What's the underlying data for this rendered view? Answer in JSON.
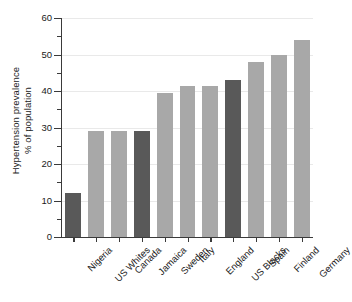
{
  "chart_data": {
    "type": "bar",
    "title": "",
    "xlabel": "",
    "ylabel": "Hypertension prevalence % of population",
    "ylabel_lines": [
      "Hypertension prevalence",
      "% of population"
    ],
    "categories": [
      "Nigeria",
      "US Whites",
      "Canada",
      "Jamaica",
      "Sweden",
      "Italy",
      "England",
      "US Blacks",
      "Spain",
      "Finland",
      "Germany"
    ],
    "values": [
      12,
      29,
      29,
      29,
      39.5,
      41.5,
      41.5,
      43,
      48,
      50,
      54
    ],
    "bar_shades": [
      "dark",
      "light",
      "light",
      "dark",
      "light",
      "light",
      "light",
      "dark",
      "light",
      "light",
      "light"
    ],
    "ylim": [
      0,
      60
    ],
    "ytick_labels": [
      "0",
      "10",
      "20",
      "30",
      "40",
      "50",
      "60"
    ],
    "ytick_values": [
      0,
      10,
      20,
      30,
      40,
      50,
      60
    ],
    "yminor_values": [
      5,
      15,
      25,
      35,
      45,
      55
    ],
    "grid": true,
    "grid_axis": "y",
    "legend": "none",
    "colors": {
      "bar_dark": "#595959",
      "bar_light": "#a8a8a8",
      "axis": "#3a3a3a",
      "gridline": "#e9e9e9",
      "background": "#ffffff",
      "text": "#1a1a1a"
    }
  }
}
